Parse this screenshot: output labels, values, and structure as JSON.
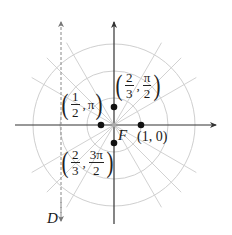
{
  "diagram": {
    "origin_label": "F",
    "directrix_label": "D",
    "grid": {
      "circle_radii_units": [
        1,
        2,
        3
      ],
      "ray_angles_deg": [
        30,
        45,
        60,
        120,
        135,
        150,
        210,
        225,
        240,
        300,
        315,
        330
      ],
      "grid_color": "#c8c8c8",
      "axis_color": "#333333"
    },
    "points": [
      {
        "id": "p1",
        "r": "1",
        "theta": "0",
        "label_text": "(1, 0)",
        "x_units": 1,
        "y_units": 0
      },
      {
        "id": "p2",
        "r_num": "1",
        "r_den": "2",
        "theta": "π",
        "label_text": "(1/2, π)",
        "x_units": -0.5,
        "y_units": 0
      },
      {
        "id": "p3",
        "r_num": "2",
        "r_den": "3",
        "theta_num": "π",
        "theta_den": "2",
        "label_text": "(2/3, π/2)",
        "x_units": 0,
        "y_units": 0.667
      },
      {
        "id": "p4",
        "r_num": "2",
        "r_den": "3",
        "theta_num": "3π",
        "theta_den": "2",
        "label_text": "(2/3, 3π/2)",
        "x_units": 0,
        "y_units": -0.667
      }
    ],
    "labels": {
      "p1": {
        "text": "(1, 0)"
      },
      "p2": {
        "open": "(",
        "num": "1",
        "den": "2",
        "comma": ",",
        "theta": "π",
        "close": ")"
      },
      "p3": {
        "open": "(",
        "num": "2",
        "den": "3",
        "comma": ",",
        "tnum": "π",
        "tden": "2",
        "close": ")"
      },
      "p4": {
        "open": "(",
        "num": "2",
        "den": "3",
        "comma": ",",
        "tnum": "3π",
        "tden": "2",
        "close": ")"
      }
    },
    "directrix_x_units": -2
  }
}
